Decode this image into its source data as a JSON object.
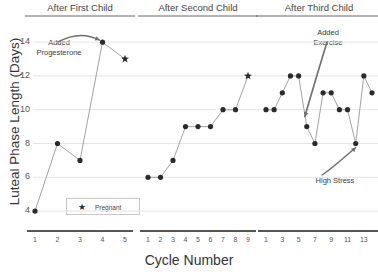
{
  "chart_data": {
    "type": "line",
    "title": "",
    "xlabel": "Cycle Number",
    "ylabel": "Luteal Phase Length (Days)",
    "ylim": [
      3,
      14.6
    ],
    "yticks": [
      4,
      6,
      8,
      10,
      12,
      14
    ],
    "grid": true,
    "legend": {
      "position": "lower-left-panel1",
      "entries": [
        {
          "label": "Pregnant",
          "marker": "star"
        }
      ]
    },
    "panels": [
      {
        "title": "After First Child",
        "x": [
          1,
          2,
          3,
          4,
          5
        ],
        "xticks": [
          "1",
          "2",
          "3",
          "4",
          "5"
        ],
        "values": [
          4,
          8,
          7,
          14,
          13
        ],
        "markers": [
          "circle",
          "circle",
          "circle",
          "circle",
          "star"
        ]
      },
      {
        "title": "After Second Child",
        "x": [
          1,
          2,
          3,
          4,
          5,
          6,
          7,
          8,
          9
        ],
        "xticks": [
          "1",
          "2",
          "3",
          "4",
          "5",
          "6",
          "7",
          "8",
          "9"
        ],
        "values": [
          6,
          6,
          7,
          9,
          9,
          9,
          10,
          10,
          12
        ],
        "markers": [
          "circle",
          "circle",
          "circle",
          "circle",
          "circle",
          "circle",
          "circle",
          "circle",
          "star"
        ]
      },
      {
        "title": "After Third Child",
        "x": [
          1,
          2,
          3,
          4,
          5,
          6,
          7,
          8,
          9,
          10,
          11,
          12,
          13,
          14
        ],
        "xticks": [
          "1",
          "",
          "3",
          "",
          "5",
          "",
          "7",
          "",
          "9",
          "",
          "11",
          "",
          "13",
          ""
        ],
        "values": [
          10,
          10,
          11,
          12,
          12,
          9,
          8,
          11,
          11,
          10,
          10,
          8,
          12,
          11
        ],
        "markers": [
          "circle",
          "circle",
          "circle",
          "circle",
          "circle",
          "circle",
          "circle",
          "circle",
          "circle",
          "circle",
          "circle",
          "circle",
          "circle",
          "circle"
        ]
      }
    ],
    "annotations": [
      {
        "text_line1": "Added",
        "text_line2": "Progesterone",
        "panel": 1,
        "points_to_cycle": 4,
        "points_to_value": 14
      },
      {
        "text_line1": "Added",
        "text_line2": "Exercise",
        "panel": 3,
        "points_to_cycle": 6,
        "points_to_value": 9
      },
      {
        "text_line1": "High Stress",
        "text_line2": "",
        "panel": 3,
        "points_to_cycle": 12,
        "points_to_value": 8
      }
    ]
  },
  "axis": {
    "y_title": "Luteal Phase Length (Days)",
    "x_title": "Cycle Number",
    "yticks": [
      "4",
      "6",
      "8",
      "10",
      "12",
      "14"
    ]
  },
  "panels": {
    "p1_title": "After First Child",
    "p2_title": "After Second Child",
    "p3_title": "After Third Child"
  },
  "annotations": {
    "progesterone_l1": "Added",
    "progesterone_l2": "Progesterone",
    "exercise_l1": "Added",
    "exercise_l2": "Exercise",
    "stress": "High Stress"
  },
  "legend": {
    "marker": "★",
    "label": "Pregnant"
  },
  "colors": {
    "marker": "#2b2b2b",
    "line": "#8a8a8a",
    "grid": "#e4e4ea",
    "axis_rule": "#555555",
    "text": "#3a3a3a"
  }
}
